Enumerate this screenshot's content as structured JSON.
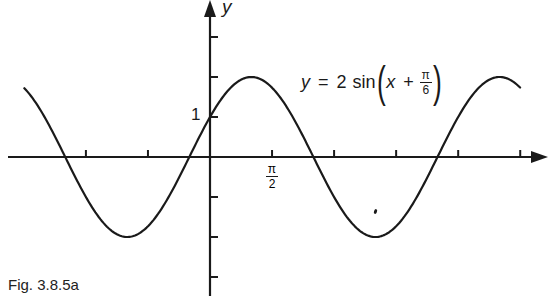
{
  "figure": {
    "caption": "Fig. 3.8.5a",
    "equation": {
      "lhs": "y",
      "equals": "=",
      "coefficient": "2",
      "function": "sin",
      "arg_var": "x",
      "plus": "+",
      "frac_num": "π",
      "frac_den": "6"
    },
    "y_axis_label": "y",
    "y_tick_label": "1",
    "x_tick_label": {
      "num": "π",
      "den": "2"
    }
  },
  "chart_data": {
    "type": "line",
    "title": "",
    "function": "y = 2 sin(x + π/6)",
    "xlabel": "",
    "ylabel": "y",
    "amplitude": 2,
    "phase_shift": -0.5236,
    "period": 6.2832,
    "xlim": [
      -4.85,
      7.9
    ],
    "ylim": [
      -3.5,
      4.0
    ],
    "x_tick_spacing": 1.5708,
    "x_ticks": [
      -3.1416,
      -1.5708,
      1.5708,
      3.1416,
      4.7124,
      6.2832,
      7.854
    ],
    "x_tick_labels": {
      "1.5708": "π/2"
    },
    "y_ticks": [
      -3,
      -2,
      -1,
      1,
      2,
      3
    ],
    "y_tick_labels": {
      "1": "1"
    },
    "curve_domain": [
      -4.7,
      7.85
    ],
    "key_points": [
      {
        "x": -3.6652,
        "y": 0,
        "note": "zero crossing"
      },
      {
        "x": -2.0944,
        "y": -2,
        "note": "minimum"
      },
      {
        "x": -0.5236,
        "y": 0,
        "note": "zero crossing"
      },
      {
        "x": 0,
        "y": 1,
        "note": "y-intercept"
      },
      {
        "x": 1.0472,
        "y": 2,
        "note": "maximum"
      },
      {
        "x": 2.618,
        "y": 0,
        "note": "zero crossing"
      },
      {
        "x": 4.1888,
        "y": -2,
        "note": "minimum"
      },
      {
        "x": 5.7596,
        "y": 0,
        "note": "zero crossing"
      },
      {
        "x": 7.3304,
        "y": 2,
        "note": "maximum"
      }
    ],
    "grid": false,
    "legend": null,
    "annotations": [
      "y = 2 sin(x + π/6)",
      "1",
      "π/2",
      "Fig. 3.8.5a"
    ]
  },
  "layout": {
    "origin_px": [
      210,
      157
    ],
    "px_per_unit_x": 39.5,
    "px_per_unit_y": 40,
    "line_color": "#1a1a1a",
    "background": "#ffffff"
  }
}
